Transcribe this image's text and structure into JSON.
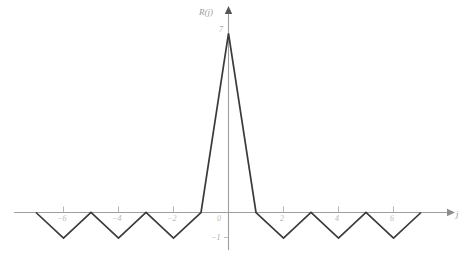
{
  "chart_data": {
    "type": "line",
    "title": "",
    "subtitle": "",
    "xlabel": "j",
    "ylabel": "R(j)",
    "grid": false,
    "legend": "none",
    "xlim": [
      -7.6,
      8.1
    ],
    "ylim": [
      -1.5,
      7.6
    ],
    "x": [
      -7,
      -6,
      -5,
      -4,
      -3,
      -2,
      -1,
      0,
      1,
      2,
      3,
      4,
      5,
      6,
      7
    ],
    "values": [
      0,
      -1,
      0,
      -1,
      0,
      -1,
      0,
      7,
      0,
      -1,
      0,
      -1,
      0,
      -1,
      0
    ],
    "series": [
      {
        "name": "R(j)",
        "values": [
          0,
          -1,
          0,
          -1,
          0,
          -1,
          0,
          7,
          0,
          -1,
          0,
          -1,
          0,
          -1,
          0
        ]
      }
    ],
    "x_tick_values": [
      -6,
      -4,
      -2,
      0,
      2,
      4,
      6
    ],
    "x_tick_labels": [
      "−6",
      "−4",
      "−2",
      "0",
      "2",
      "4",
      "6"
    ],
    "y_tick_values": [
      -1,
      7
    ],
    "y_tick_labels": [
      "−1",
      "7"
    ],
    "peak_label": "7",
    "floor_label": "−1",
    "origin_label": "0"
  },
  "axes": {
    "x_axis_name": "j",
    "y_axis_name": "R(j)",
    "x_arrow": "right-arrow",
    "y_arrow": "up-arrow"
  },
  "style": {
    "curve_color": "#3a3a3a",
    "axis_color": "#9e9e9e",
    "tick_color": "#b5b5b5",
    "label_color": "#b9b9b9",
    "background": "#ffffff"
  }
}
